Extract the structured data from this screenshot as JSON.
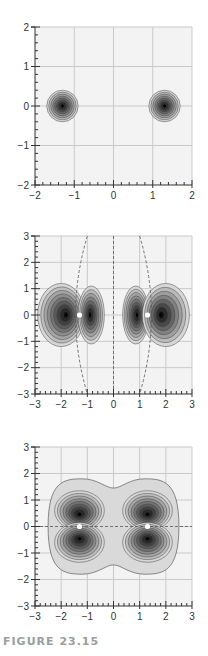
{
  "caption": "FIGURE 23.15",
  "colors": {
    "background": "#f3f3f3",
    "grid": "#c9c9c9",
    "axis": "#333333",
    "contour_stroke": "#444444",
    "caption": "#9a9da1"
  },
  "chart_data": [
    {
      "type": "heatmap",
      "subtype": "contour",
      "title": "",
      "description": "Two isolated spherical (1s-like) density maxima centered on nuclei",
      "xlabel": "",
      "ylabel": "",
      "xlim": [
        -2,
        2
      ],
      "ylim": [
        -2,
        2
      ],
      "xticks": [
        -2,
        -1,
        0,
        1,
        2
      ],
      "yticks": [
        -2,
        -1,
        0,
        1,
        2
      ],
      "grid": true,
      "nuclei": [
        [
          -1.3,
          0
        ],
        [
          1.3,
          0
        ]
      ],
      "lobes": [
        {
          "cx": -1.3,
          "cy": 0,
          "rx": 0.4,
          "ry": 0.4,
          "levels": 8
        },
        {
          "cx": 1.3,
          "cy": 0,
          "rx": 0.4,
          "ry": 0.4,
          "levels": 8
        }
      ],
      "nodal_lines": []
    },
    {
      "type": "heatmap",
      "subtype": "contour",
      "title": "",
      "description": "p-sigma type orbital contours with four lobes along the internuclear axis and dashed nodal surfaces",
      "xlabel": "",
      "ylabel": "",
      "xlim": [
        -3,
        3
      ],
      "ylim": [
        -3,
        3
      ],
      "xticks": [
        -3,
        -2,
        -1,
        0,
        1,
        2,
        3
      ],
      "yticks": [
        -3,
        -2,
        -1,
        0,
        1,
        2,
        3
      ],
      "grid": true,
      "nuclei": [
        [
          -1.3,
          0
        ],
        [
          1.3,
          0
        ]
      ],
      "lobes": [
        {
          "cx": -2.0,
          "cy": 0,
          "rx": 0.9,
          "ry": 1.2,
          "peak": [
            -1.8,
            0
          ],
          "levels": 9
        },
        {
          "cx": -0.85,
          "cy": 0,
          "rx": 0.5,
          "ry": 1.1,
          "peak": [
            -0.9,
            0
          ],
          "levels": 8
        },
        {
          "cx": 0.85,
          "cy": 0,
          "rx": 0.5,
          "ry": 1.1,
          "peak": [
            0.9,
            0
          ],
          "levels": 9
        },
        {
          "cx": 2.0,
          "cy": 0,
          "rx": 0.9,
          "ry": 1.2,
          "peak": [
            1.8,
            0
          ],
          "levels": 8
        }
      ],
      "nodal_lines": [
        {
          "type": "curve",
          "points": [
            [
              -1.0,
              3
            ],
            [
              -1.45,
              0
            ],
            [
              -1.0,
              -3
            ]
          ]
        },
        {
          "type": "line",
          "points": [
            [
              0,
              3
            ],
            [
              0,
              -3
            ]
          ]
        },
        {
          "type": "curve",
          "points": [
            [
              1.0,
              3
            ],
            [
              1.45,
              0
            ],
            [
              1.0,
              -3
            ]
          ]
        }
      ]
    },
    {
      "type": "heatmap",
      "subtype": "contour",
      "title": "",
      "description": "p-pi type orbital contours with four lobes above and below the internuclear axis; dashed horizontal nodal line at y=0",
      "xlabel": "",
      "ylabel": "",
      "xlim": [
        -3,
        3
      ],
      "ylim": [
        -3,
        3
      ],
      "xticks": [
        -3,
        -2,
        -1,
        0,
        1,
        2,
        3
      ],
      "yticks": [
        -3,
        -2,
        -1,
        0,
        1,
        2,
        3
      ],
      "grid": true,
      "nuclei": [
        [
          -1.3,
          0
        ],
        [
          1.3,
          0
        ]
      ],
      "lobes": [
        {
          "cx": -1.3,
          "cy": 0.6,
          "rx": 0.95,
          "ry": 0.75,
          "peak": [
            -1.3,
            0.45
          ],
          "levels": 9
        },
        {
          "cx": 1.3,
          "cy": 0.6,
          "rx": 0.95,
          "ry": 0.75,
          "peak": [
            1.3,
            0.45
          ],
          "levels": 9
        },
        {
          "cx": -1.3,
          "cy": -0.6,
          "rx": 0.95,
          "ry": 0.75,
          "peak": [
            -1.3,
            -0.45
          ],
          "levels": 9
        },
        {
          "cx": 1.3,
          "cy": -0.6,
          "rx": 0.95,
          "ry": 0.75,
          "peak": [
            1.3,
            -0.45
          ],
          "levels": 9
        }
      ],
      "outer_envelope": {
        "x_extent": [
          -2.5,
          2.5
        ],
        "y_extent": [
          -1.8,
          1.8
        ],
        "waist_y": 1.45
      },
      "nodal_lines": [
        {
          "type": "line",
          "points": [
            [
              -3,
              0
            ],
            [
              3,
              0
            ]
          ]
        }
      ]
    }
  ],
  "panels": [
    {
      "left": 35,
      "top": 27,
      "right": 192,
      "bottom": 185
    },
    {
      "left": 35,
      "top": 236,
      "right": 192,
      "bottom": 394
    },
    {
      "left": 35,
      "top": 447,
      "right": 192,
      "bottom": 606
    }
  ]
}
